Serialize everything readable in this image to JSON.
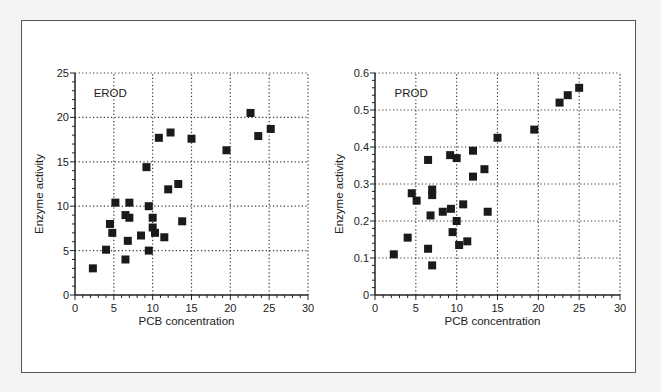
{
  "chart_data": [
    {
      "type": "scatter",
      "title": "EROD",
      "xlabel": "PCB concentration",
      "ylabel": "Enzyme activity",
      "xlim": [
        0,
        30
      ],
      "ylim": [
        0,
        25
      ],
      "xticks": [
        0,
        5,
        10,
        15,
        20,
        25,
        30
      ],
      "yticks": [
        0,
        5,
        10,
        15,
        20,
        25
      ],
      "grid": true,
      "marker": "square",
      "series": [
        {
          "name": "EROD",
          "points": [
            [
              2.3,
              3.0
            ],
            [
              4.0,
              5.1
            ],
            [
              4.5,
              8.0
            ],
            [
              4.8,
              7.0
            ],
            [
              5.2,
              10.4
            ],
            [
              6.5,
              4.0
            ],
            [
              6.5,
              9.0
            ],
            [
              6.8,
              6.1
            ],
            [
              7.0,
              8.7
            ],
            [
              7.0,
              10.4
            ],
            [
              8.5,
              6.7
            ],
            [
              9.2,
              14.4
            ],
            [
              9.5,
              10.0
            ],
            [
              9.5,
              5.0
            ],
            [
              10.0,
              8.7
            ],
            [
              10.0,
              7.6
            ],
            [
              10.3,
              7.0
            ],
            [
              10.8,
              17.7
            ],
            [
              11.5,
              6.5
            ],
            [
              12.0,
              11.9
            ],
            [
              12.3,
              18.3
            ],
            [
              13.3,
              12.5
            ],
            [
              13.8,
              8.3
            ],
            [
              15.0,
              17.6
            ],
            [
              19.5,
              16.3
            ],
            [
              22.6,
              20.5
            ],
            [
              23.6,
              17.9
            ],
            [
              25.2,
              18.7
            ]
          ]
        }
      ]
    },
    {
      "type": "scatter",
      "title": "PROD",
      "xlabel": "PCB concentration",
      "ylabel": "Enzyme activity",
      "xlim": [
        0,
        30
      ],
      "ylim": [
        0,
        0.6
      ],
      "xticks": [
        0,
        5,
        10,
        15,
        20,
        25,
        30
      ],
      "yticks": [
        0,
        0.1,
        0.2,
        0.3,
        0.4,
        0.5,
        0.6
      ],
      "grid": true,
      "marker": "square",
      "series": [
        {
          "name": "PROD",
          "points": [
            [
              2.3,
              0.11
            ],
            [
              4.0,
              0.155
            ],
            [
              4.5,
              0.275
            ],
            [
              5.1,
              0.255
            ],
            [
              6.5,
              0.365
            ],
            [
              6.5,
              0.125
            ],
            [
              6.8,
              0.215
            ],
            [
              7.0,
              0.285
            ],
            [
              7.0,
              0.27
            ],
            [
              7.0,
              0.08
            ],
            [
              8.3,
              0.225
            ],
            [
              9.2,
              0.378
            ],
            [
              9.3,
              0.233
            ],
            [
              9.5,
              0.17
            ],
            [
              10.0,
              0.37
            ],
            [
              10.0,
              0.2
            ],
            [
              10.3,
              0.135
            ],
            [
              10.8,
              0.245
            ],
            [
              11.3,
              0.145
            ],
            [
              12.0,
              0.39
            ],
            [
              12.0,
              0.32
            ],
            [
              13.4,
              0.34
            ],
            [
              13.8,
              0.225
            ],
            [
              15.0,
              0.425
            ],
            [
              19.5,
              0.447
            ],
            [
              22.6,
              0.52
            ],
            [
              23.6,
              0.54
            ],
            [
              25.0,
              0.56
            ]
          ]
        }
      ]
    }
  ],
  "colors": {
    "marker": "#1a1a1a",
    "axis": "#222222",
    "grid": "#333333",
    "frame": "#555555",
    "background": "#ffffff"
  }
}
